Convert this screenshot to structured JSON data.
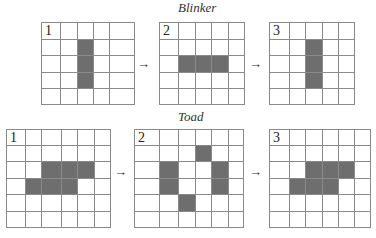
{
  "blinker": {
    "title": "Blinker",
    "title_pos": [
      178,
      0
    ],
    "arrows": [
      {
        "glyph": "→",
        "x": 137,
        "y": 57
      },
      {
        "glyph": "→",
        "x": 249,
        "y": 57
      }
    ],
    "grids": [
      {
        "label": "1",
        "cols": [
          41,
          60,
          77,
          93,
          109,
          134
        ],
        "rows": [
          22,
          39,
          55,
          72,
          88,
          104
        ],
        "filled": [
          [
            1,
            2
          ],
          [
            2,
            2
          ],
          [
            3,
            2
          ]
        ]
      },
      {
        "label": "2",
        "cols": [
          159,
          178,
          195,
          211,
          228,
          244
        ],
        "rows": [
          22,
          39,
          55,
          72,
          88,
          104
        ],
        "filled": [
          [
            2,
            1
          ],
          [
            2,
            2
          ],
          [
            2,
            3
          ]
        ]
      },
      {
        "label": "3",
        "cols": [
          269,
          289,
          305,
          322,
          338,
          354
        ],
        "rows": [
          22,
          39,
          55,
          72,
          88,
          104
        ],
        "filled": [
          [
            1,
            2
          ],
          [
            2,
            2
          ],
          [
            3,
            2
          ]
        ]
      }
    ]
  },
  "toad": {
    "title": "Toad",
    "title_pos": [
      178,
      109
    ],
    "arrows": [
      {
        "glyph": "→",
        "x": 114,
        "y": 165
      },
      {
        "glyph": "→",
        "x": 249,
        "y": 165
      }
    ],
    "grids": [
      {
        "label": "1",
        "cols": [
          6,
          25,
          41,
          61,
          77,
          94,
          110
        ],
        "rows": [
          129,
          145,
          161,
          178,
          194,
          211,
          227
        ],
        "filled": [
          [
            2,
            2
          ],
          [
            2,
            3
          ],
          [
            2,
            4
          ],
          [
            3,
            1
          ],
          [
            3,
            2
          ],
          [
            3,
            3
          ]
        ]
      },
      {
        "label": "2",
        "cols": [
          134,
          159,
          178,
          195,
          211,
          228,
          243
        ],
        "rows": [
          129,
          145,
          161,
          178,
          194,
          211,
          227
        ],
        "filled": [
          [
            1,
            3
          ],
          [
            2,
            1
          ],
          [
            3,
            1
          ],
          [
            2,
            4
          ],
          [
            3,
            4
          ],
          [
            4,
            2
          ]
        ]
      },
      {
        "label": "3",
        "cols": [
          269,
          289,
          305,
          322,
          338,
          354,
          370
        ],
        "rows": [
          129,
          145,
          161,
          178,
          194,
          211,
          227
        ],
        "filled": [
          [
            2,
            2
          ],
          [
            2,
            3
          ],
          [
            2,
            4
          ],
          [
            3,
            1
          ],
          [
            3,
            2
          ],
          [
            3,
            3
          ]
        ]
      }
    ]
  },
  "colors": {
    "grid_line": "#8a8a8a",
    "filled_cell": "#6e6e6e",
    "background": "#ffffff"
  }
}
